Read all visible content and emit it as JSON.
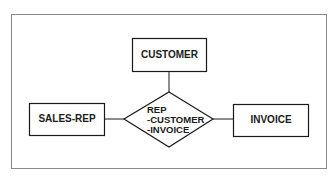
{
  "diagram": {
    "type": "entity-relationship",
    "entities": [
      {
        "id": "customer",
        "label": "CUSTOMER"
      },
      {
        "id": "sales_rep",
        "label": "SALES-REP"
      },
      {
        "id": "invoice",
        "label": "INVOICE"
      }
    ],
    "relationship": {
      "lines": [
        "REP",
        "-CUSTOMER",
        "-INVOICE"
      ]
    },
    "colors": {
      "stroke": "#1a1a1a",
      "frame": "#777777",
      "background": "#ffffff"
    }
  }
}
